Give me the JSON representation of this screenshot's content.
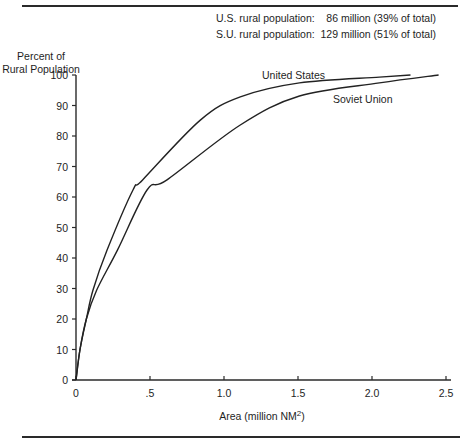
{
  "notes": {
    "us": "U.S. rural population:    86 million (39% of total)",
    "su": "S.U. rural population:  129 million (51% of total)"
  },
  "chart_data": {
    "type": "line",
    "title": "",
    "ylabel": "Percent of Rural Population",
    "xlabel": "Area (million NM²)",
    "xlim": [
      0,
      2.5
    ],
    "ylim": [
      0,
      100
    ],
    "xticks": [
      0,
      0.5,
      1.0,
      1.5,
      2.0,
      2.5
    ],
    "xtick_labels": [
      "0",
      ".5",
      "1.0",
      "1.5",
      "2.0",
      "2.5"
    ],
    "yticks": [
      0,
      10,
      20,
      30,
      40,
      50,
      60,
      70,
      80,
      90,
      100
    ],
    "grid": false,
    "legend": "inline labels",
    "annotations": [
      "U.S. rural population: 86 million (39% of total)",
      "S.U. rural population: 129 million (51% of total)"
    ],
    "series": [
      {
        "name": "United States",
        "x": [
          0,
          0.027,
          0.07,
          0.115,
          0.21,
          0.385,
          0.45,
          0.84,
          1.11,
          1.51,
          2.05,
          2.26
        ],
        "y": [
          0,
          10,
          20,
          29.5,
          42.6,
          62.3,
          65.6,
          85.2,
          92.8,
          97.4,
          99.3,
          100
        ]
      },
      {
        "name": "Soviet Union",
        "x": [
          0,
          0.027,
          0.07,
          0.14,
          0.28,
          0.48,
          0.615,
          1.11,
          1.51,
          2.05,
          2.45
        ],
        "y": [
          0,
          10,
          20,
          29.5,
          42.6,
          62.3,
          65.6,
          83.6,
          93.1,
          97.4,
          100
        ]
      }
    ]
  },
  "labels": {
    "ylabel_line1": "Percent of",
    "ylabel_line2": "Rural Population",
    "xlabel_main": "Area  (million NM",
    "xlabel_sup": "2",
    "xlabel_close": ")",
    "us_curve": "United States",
    "su_curve": "Soviet Union"
  }
}
